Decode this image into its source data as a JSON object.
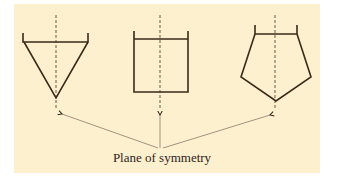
{
  "figure": {
    "background_color": "#fdf0cf",
    "line_color": "#3a2a1a",
    "axis_color": "#6b5a4a",
    "arrow_color": "#8a7a6a",
    "caption": "Plane of symmetry",
    "shapes": [
      {
        "name": "triangle",
        "description": "inverted triangle with open-top rim ticks"
      },
      {
        "name": "square",
        "description": "square with open-top rim ticks"
      },
      {
        "name": "pentagon",
        "description": "pentagon pointing down with open-top rim ticks"
      }
    ]
  }
}
